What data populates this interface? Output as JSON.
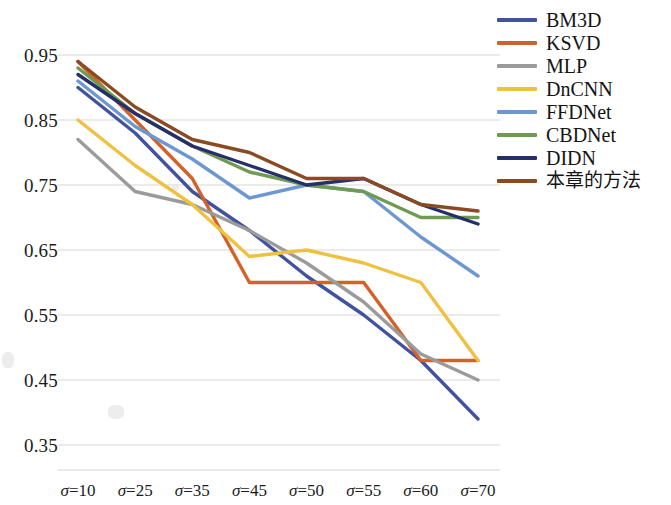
{
  "chart_data": {
    "type": "line",
    "title": "",
    "subtitle": "",
    "xlabel": "",
    "ylabel": "",
    "categories": [
      "σ=10",
      "σ=25",
      "σ=35",
      "σ=45",
      "σ=50",
      "σ=55",
      "σ=60",
      "σ=70"
    ],
    "ylim": [
      0.35,
      0.95
    ],
    "yticks": [
      0.35,
      0.45,
      0.55,
      0.65,
      0.75,
      0.85,
      0.95
    ],
    "ytick_labels": [
      "0.35",
      "0.45",
      "0.55",
      "0.65",
      "0.75",
      "0.85",
      "0.95"
    ],
    "grid": true,
    "grid_axis": "y",
    "legend_position": "right",
    "series": [
      {
        "name": "BM3D",
        "color": "#41539f",
        "values": [
          0.9,
          0.83,
          0.74,
          0.68,
          0.61,
          0.55,
          0.48,
          0.39
        ]
      },
      {
        "name": "KSVD",
        "color": "#d2622a",
        "values": [
          0.94,
          0.85,
          0.76,
          0.6,
          0.6,
          0.6,
          0.48,
          0.48
        ]
      },
      {
        "name": "MLP",
        "color": "#9b9b9b",
        "values": [
          0.82,
          0.74,
          0.72,
          0.68,
          0.63,
          0.57,
          0.49,
          0.45
        ]
      },
      {
        "name": "DnCNN",
        "color": "#eec140",
        "values": [
          0.85,
          0.78,
          0.72,
          0.64,
          0.65,
          0.63,
          0.6,
          0.48
        ]
      },
      {
        "name": "FFDNet",
        "color": "#6d97d1",
        "values": [
          0.91,
          0.84,
          0.79,
          0.73,
          0.75,
          0.74,
          0.67,
          0.61
        ]
      },
      {
        "name": "CBDNet",
        "color": "#6f9a52",
        "values": [
          0.93,
          0.86,
          0.81,
          0.77,
          0.75,
          0.74,
          0.7,
          0.7
        ]
      },
      {
        "name": "DIDN",
        "color": "#252f6a",
        "values": [
          0.92,
          0.86,
          0.81,
          0.78,
          0.75,
          0.76,
          0.72,
          0.69
        ]
      },
      {
        "name": "本章的方法",
        "color": "#8a4a22",
        "values": [
          0.94,
          0.87,
          0.82,
          0.8,
          0.76,
          0.76,
          0.72,
          0.71
        ]
      }
    ]
  },
  "legend": {
    "items": [
      {
        "label": "BM3D"
      },
      {
        "label": "KSVD"
      },
      {
        "label": "MLP"
      },
      {
        "label": "DnCNN"
      },
      {
        "label": "FFDNet"
      },
      {
        "label": "CBDNet"
      },
      {
        "label": "DIDN"
      },
      {
        "label": "本章的方法"
      }
    ]
  },
  "colors": {
    "grid": "#e4e4e4",
    "text": "#1b1b1b",
    "background": "#ffffff"
  }
}
